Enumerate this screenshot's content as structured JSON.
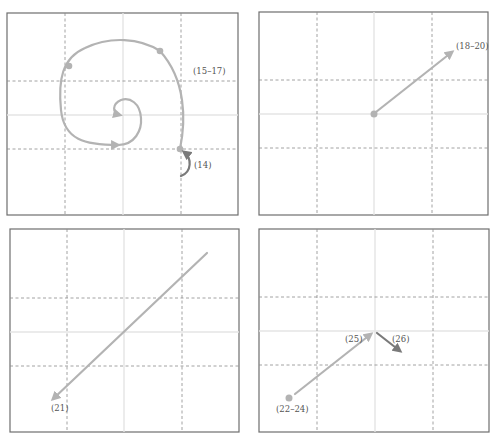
{
  "figure": {
    "panels": [
      {
        "id": "panel-1",
        "position": "top-left",
        "labels": [
          {
            "text": "(15–17)",
            "x": 193,
            "y": 72
          },
          {
            "text": "(14)",
            "x": 194,
            "y": 167
          }
        ],
        "description": "Inward spiral trajectory starting at grid point, with markers, ending at center"
      },
      {
        "id": "panel-2",
        "position": "top-right",
        "labels": [
          {
            "text": "(18–20)",
            "x": 456,
            "y": 48
          }
        ],
        "description": "Straight arrow from center toward upper-right"
      },
      {
        "id": "panel-3",
        "position": "bottom-left",
        "labels": [
          {
            "text": "(21)",
            "x": 51,
            "y": 409
          }
        ],
        "description": "Long arrow from upper-right to lower-left"
      },
      {
        "id": "panel-4",
        "position": "bottom-right",
        "labels": [
          {
            "text": "(22–24)",
            "x": 289,
            "y": 410
          },
          {
            "text": "(25)",
            "x": 351,
            "y": 341
          },
          {
            "text": "(26)",
            "x": 397,
            "y": 341
          }
        ],
        "description": "Arrow from lower-left dot to center, then short dark arrow down-right"
      }
    ],
    "colors": {
      "frame": "#6e6e6e",
      "grid_dashed": "#8a8a8a",
      "grid_center": "#e4e4e4",
      "trajectory_light": "#b3b3b3",
      "trajectory_dark": "#7a7a7a"
    }
  }
}
